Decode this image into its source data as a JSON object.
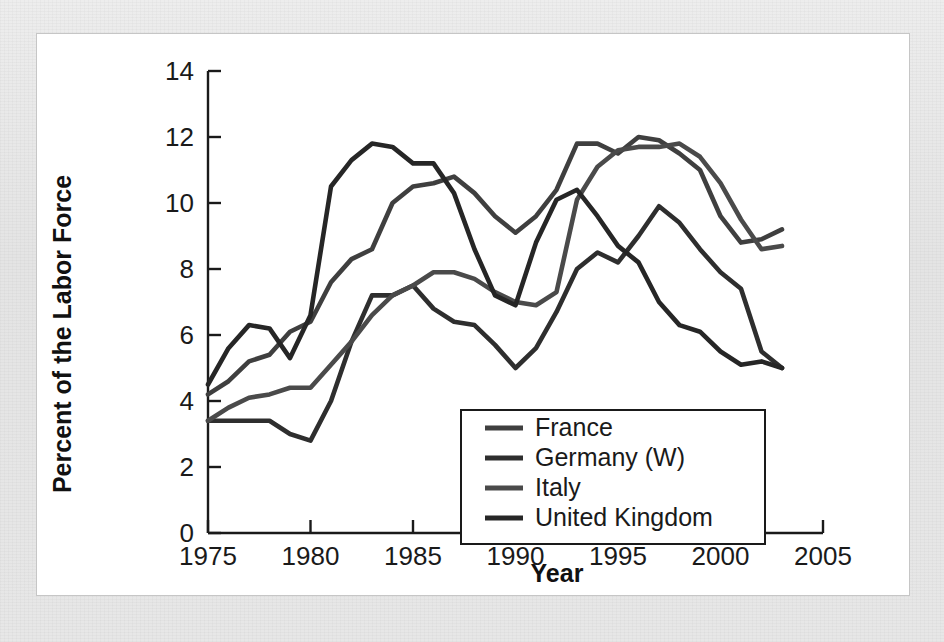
{
  "figure": {
    "background_color": "#e9e9e9",
    "card_color": "#ffffff",
    "card_border_color": "#c6c6c6"
  },
  "chart_data": {
    "type": "line",
    "title": "",
    "xlabel": "Year",
    "ylabel": "Percent of the Labor Force",
    "xlim": [
      1975,
      2005
    ],
    "ylim": [
      0,
      14
    ],
    "xticks": [
      1975,
      1980,
      1985,
      1990,
      1995,
      2000,
      2005
    ],
    "xtick_labels": [
      "1975",
      "1980",
      "1985",
      "1990",
      "1995",
      "2000",
      "2005"
    ],
    "yticks": [
      0,
      2,
      4,
      6,
      8,
      10,
      12,
      14
    ],
    "ytick_labels": [
      "0",
      "2",
      "4",
      "6",
      "8",
      "10",
      "12",
      "14"
    ],
    "grid": false,
    "legend_position": "lower-center-right",
    "x": [
      1975,
      1976,
      1977,
      1978,
      1979,
      1980,
      1981,
      1982,
      1983,
      1984,
      1985,
      1986,
      1987,
      1988,
      1989,
      1990,
      1991,
      1992,
      1993,
      1994,
      1995,
      1996,
      1997,
      1998,
      1999,
      2000,
      2001,
      2002,
      2003
    ],
    "series": [
      {
        "name": "France",
        "color": "#3f3f3f",
        "values": [
          4.2,
          4.6,
          5.2,
          5.4,
          6.1,
          6.4,
          7.6,
          8.3,
          8.6,
          10.0,
          10.5,
          10.6,
          10.8,
          10.3,
          9.6,
          9.1,
          9.6,
          10.4,
          11.8,
          11.8,
          11.5,
          12.0,
          11.9,
          11.5,
          11.0,
          9.6,
          8.8,
          8.9,
          9.2
        ]
      },
      {
        "name": "Germany (W)",
        "color": "#2e2e2e",
        "values": [
          3.4,
          3.4,
          3.4,
          3.4,
          3.0,
          2.8,
          4.0,
          5.8,
          7.2,
          7.2,
          7.5,
          6.8,
          6.4,
          6.3,
          5.7,
          5.0,
          5.6,
          6.7,
          8.0,
          8.5,
          8.2,
          9.0,
          9.9,
          9.4,
          8.6,
          7.9,
          7.4,
          5.5,
          5.0
        ]
      },
      {
        "name": "Italy",
        "color": "#4a4a4a",
        "values": [
          3.4,
          3.8,
          4.1,
          4.2,
          4.4,
          4.4,
          5.1,
          5.8,
          6.6,
          7.2,
          7.5,
          7.9,
          7.9,
          7.7,
          7.3,
          7.0,
          6.9,
          7.3,
          10.1,
          11.1,
          11.6,
          11.7,
          11.7,
          11.8,
          11.4,
          10.6,
          9.5,
          8.6,
          8.7
        ]
      },
      {
        "name": "United Kingdom",
        "color": "#262626",
        "values": [
          4.5,
          5.6,
          6.3,
          6.2,
          5.3,
          6.6,
          10.5,
          11.3,
          11.8,
          11.7,
          11.2,
          11.2,
          10.3,
          8.6,
          7.2,
          6.9,
          8.8,
          10.1,
          10.4,
          9.6,
          8.7,
          8.2,
          7.0,
          6.3,
          6.1,
          5.5,
          5.1,
          5.2,
          5.0
        ]
      }
    ]
  },
  "legend": {
    "items": [
      {
        "label": "France",
        "color": "#3f3f3f"
      },
      {
        "label": "Germany (W)",
        "color": "#2e2e2e"
      },
      {
        "label": "Italy",
        "color": "#4a4a4a"
      },
      {
        "label": "United Kingdom",
        "color": "#262626"
      }
    ]
  }
}
